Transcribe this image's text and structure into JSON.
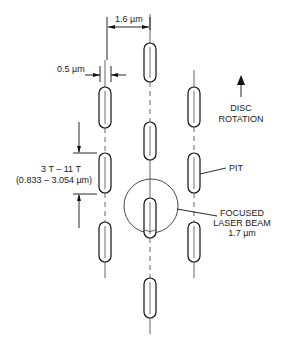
{
  "diagram": {
    "labels": {
      "track_pitch": "1.6 µm",
      "pit_width": "0.5 µm",
      "pit_length_line1": "3 T – 11 T",
      "pit_length_line2": "(0.833 – 3.054 µm)",
      "rotation_line1": "DISC",
      "rotation_line2": "ROTATION",
      "pit": "PIT",
      "beam_line1": "FOCUSED",
      "beam_line2": "LASER BEAM",
      "beam_line3": "1.7 µm"
    },
    "tracks": [
      {
        "name": "left-track",
        "x": 105,
        "pits": [
          [
            87,
            128
          ],
          [
            153,
            193
          ],
          [
            222,
            262
          ]
        ]
      },
      {
        "name": "center-track",
        "x": 150,
        "pits": [
          [
            43,
            82
          ],
          [
            122,
            160
          ],
          [
            198,
            238
          ],
          [
            278,
            318
          ]
        ]
      },
      {
        "name": "right-track",
        "x": 194,
        "pits": [
          [
            87,
            127
          ],
          [
            153,
            193
          ],
          [
            222,
            262
          ]
        ]
      }
    ],
    "laser_spot": {
      "cx": 151,
      "cy": 206,
      "r": 27
    },
    "colors": {
      "line": "#111111",
      "background": "#ffffff"
    }
  }
}
